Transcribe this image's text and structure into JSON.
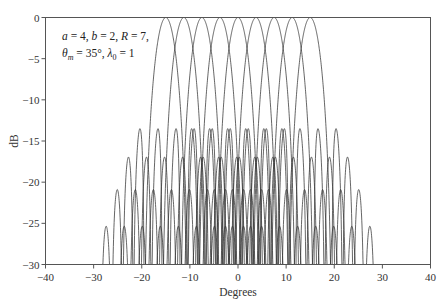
{
  "chart_data": {
    "type": "line",
    "title": "",
    "xlabel": "Degrees",
    "ylabel": "dB",
    "xlim": [
      -40,
      40
    ],
    "ylim": [
      -30,
      0
    ],
    "x_ticks": [
      -40,
      -30,
      -20,
      -10,
      0,
      10,
      20,
      30,
      40
    ],
    "y_ticks": [
      0,
      -5,
      -10,
      -15,
      -20,
      -25,
      -30
    ],
    "x_tick_labels": [
      "−40",
      "−30",
      "−20",
      "−10",
      "0",
      "10",
      "20",
      "30",
      "40"
    ],
    "y_tick_labels": [
      "0",
      "−5",
      "−10",
      "−15",
      "−20",
      "−25",
      "−30"
    ],
    "grid": false,
    "legend": null,
    "annotation": {
      "line1": "a = 4, b = 2, R = 7,",
      "line2": "θm = 35°, λ0 = 1",
      "params": {
        "a": 4,
        "b": 2,
        "R": 7,
        "theta_m_deg": 35,
        "lambda0": 1
      }
    },
    "series_description": "Nine overlapping beam patterns (dB vs. degrees), each peaking at 0 dB",
    "beam_centers_deg": [
      -15,
      -11.25,
      -7.5,
      -3.75,
      0,
      3.75,
      7.5,
      11.25,
      15
    ],
    "beam_peak_db": 0,
    "main_lobe_null_offset_deg": 4.5,
    "sidelobe_null_spacing_deg": 2.25,
    "first_sidelobe_db_approx": -13.5,
    "pattern_extent_deg": [
      -29.5,
      29.5
    ],
    "floor_db": -30
  },
  "labels": {
    "xlabel": "Degrees",
    "ylabel": "dB",
    "annot_a": "a",
    "annot_rest1": " = 4, ",
    "annot_b": "b",
    "annot_rest2": " = 2, ",
    "annot_R": "R",
    "annot_rest3": " = 7,",
    "annot_theta": "θ",
    "annot_m": "m",
    "annot_rest4": " = 35°, ",
    "annot_lambda": "λ",
    "annot_0": "0",
    "annot_rest5": " = 1"
  }
}
